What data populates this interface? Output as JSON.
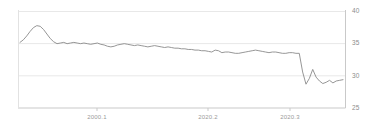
{
  "chart_data": {
    "type": "line",
    "title": "",
    "subtitle": "",
    "xlabel": "",
    "ylabel": "",
    "grid": true,
    "legend": null,
    "ylim": [
      25,
      40
    ],
    "yticks": [
      25,
      30,
      35,
      40
    ],
    "ytick_labels": [
      "25",
      "30",
      "35",
      "40"
    ],
    "xlim": [
      0,
      96
    ],
    "xticks": [
      28,
      56,
      84
    ],
    "xtick_labels": [
      "2000.1",
      "2020.2",
      "2020.3"
    ],
    "line_color": "#8a8a8a",
    "grid_color": "#e6e6e6",
    "axis_color": "#cfcfcf",
    "series": [
      {
        "name": "series-1",
        "values": [
          35.2,
          35.6,
          36.2,
          36.9,
          37.5,
          37.8,
          37.7,
          37.2,
          36.5,
          35.8,
          35.3,
          35.0,
          35.1,
          35.2,
          35.0,
          35.1,
          35.2,
          35.1,
          35.0,
          35.1,
          35.0,
          34.9,
          35.0,
          35.1,
          34.9,
          34.8,
          34.6,
          34.5,
          34.6,
          34.8,
          34.9,
          35.0,
          34.9,
          34.8,
          34.7,
          34.8,
          34.7,
          34.6,
          34.5,
          34.6,
          34.7,
          34.6,
          34.5,
          34.4,
          34.5,
          34.4,
          34.3,
          34.3,
          34.2,
          34.2,
          34.1,
          34.1,
          34.0,
          34.0,
          33.9,
          33.9,
          33.8,
          33.7,
          34.0,
          33.9,
          33.6,
          33.7,
          33.7,
          33.6,
          33.5,
          33.5,
          33.6,
          33.7,
          33.8,
          33.9,
          34.0,
          33.9,
          33.8,
          33.7,
          33.6,
          33.7,
          33.7,
          33.6,
          33.5,
          33.5,
          33.6,
          33.6,
          33.5,
          33.5,
          30.6,
          28.7,
          29.6,
          31.0,
          29.8,
          29.2,
          28.8,
          29.0,
          29.3,
          28.9,
          29.2,
          29.3,
          29.4
        ]
      }
    ]
  },
  "axes": {
    "y_labels": [
      {
        "text": "40",
        "value": 40
      },
      {
        "text": "35",
        "value": 35
      },
      {
        "text": "30",
        "value": 30
      },
      {
        "text": "25",
        "value": 25
      }
    ],
    "x_labels": [
      {
        "text": "2000.1",
        "index": 28
      },
      {
        "text": "2020.2",
        "index": 56
      },
      {
        "text": "2020.3",
        "index": 84
      }
    ]
  }
}
